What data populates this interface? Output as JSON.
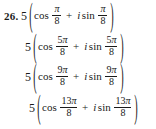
{
  "problem": {
    "number": "26.",
    "coefficient": "5",
    "open_paren": "(",
    "close_paren": ")",
    "cos_label": "cos",
    "sin_label": "sin",
    "imaginary_unit": "i",
    "plus_sign": "+",
    "pi_symbol": "π",
    "denominator": "8",
    "text_color": "#1a1a1a",
    "background_color": "#ffffff"
  },
  "choices": [
    {
      "id": "choice-a",
      "expression": "5(cos π/8 + i sin π/8)",
      "coefficient": "5",
      "angle_numerator": "π",
      "angle_numerator_coefficient": "",
      "angle_denominator": "8",
      "angle_text": "π/8"
    },
    {
      "id": "choice-b",
      "expression": "5(cos 5π/8 + i sin 5π/8)",
      "coefficient": "5",
      "angle_numerator": "π",
      "angle_numerator_coefficient": "5",
      "angle_denominator": "8",
      "angle_text": "5π/8"
    },
    {
      "id": "choice-c",
      "expression": "5(cos 9π/8 + i sin 9π/8)",
      "coefficient": "5",
      "angle_numerator": "π",
      "angle_numerator_coefficient": "9",
      "angle_denominator": "8",
      "angle_text": "9π/8"
    },
    {
      "id": "choice-d",
      "expression": "5(cos 13π/8 + i sin 13π/8)",
      "coefficient": "5",
      "angle_numerator": "π",
      "angle_numerator_coefficient": "13",
      "angle_denominator": "8",
      "angle_text": "13π/8"
    }
  ]
}
